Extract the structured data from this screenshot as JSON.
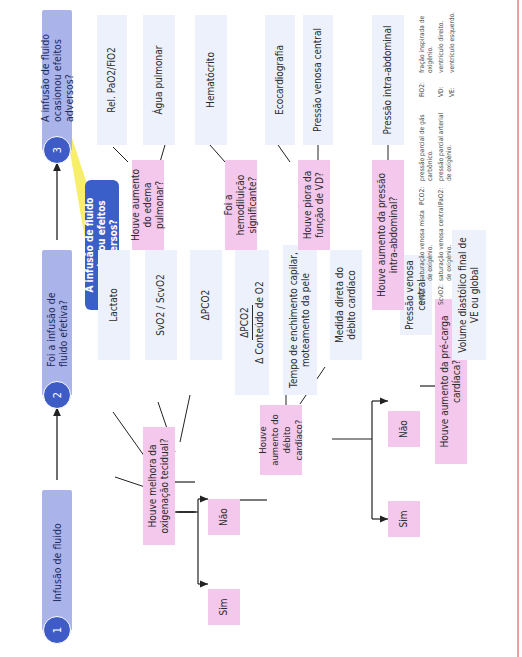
{
  "steps": [
    {
      "number": "1",
      "title": "Infusão de fluido"
    },
    {
      "number": "2",
      "title": "Foi a infusão de fluido efetiva?"
    },
    {
      "number": "3",
      "title": "A infusão de fluido ocasionou efeitos adversos?"
    }
  ],
  "callout": "A infusão de fluido ocasionou efeitos adversos?",
  "efficacy": {
    "question_oxygenation": "Houve melhora da oxigenação tecidual?",
    "oxygenation_markers": [
      "Lactato",
      "SvO2 / ScvO2",
      "ΔPCO2"
    ],
    "oxygenation_ratio": {
      "numerator": "ΔPCO2",
      "denominator": "Δ Conteúdo de O2"
    },
    "yes_label": "Sim",
    "no_label": "Não",
    "question_cardiac_output": "Houve aumento do débito cardíaco?",
    "cardiac_output_markers": [
      "Tempo de enchimento capilar, moteamento da pele",
      "Medida direta do débito cardíaco"
    ],
    "co_yes_label": "Sim",
    "co_no_label": "Não",
    "question_preload": "Houve aumento da pré-carga cardíaca?",
    "preload_markers": [
      "Pressão venosa central",
      "Volume diastólico final de VE ou global"
    ]
  },
  "adverse": [
    {
      "question": "Houve aumento do edema pulmonar?",
      "markers": [
        "Rel. PaO2/FiO2",
        "Água pulmonar"
      ]
    },
    {
      "question": "Foi a hemodiluição significante?",
      "markers": [
        "Hematócrito"
      ]
    },
    {
      "question": "Houve piora da função de VD?",
      "markers": [
        "Ecocardiografia",
        "Pressão venosa central"
      ]
    },
    {
      "question": "Houve aumento da pressão intra-abdominal?",
      "markers": [
        "Pressão intra-abdominal"
      ]
    }
  ],
  "legend": [
    {
      "abbr": "SvO2:",
      "text": "saturação venosa mista de oxigênio."
    },
    {
      "abbr": "ScvO2:",
      "text": "saturação venosa central de oxigênio."
    },
    {
      "abbr": "PCO2:",
      "text": "pressão parcial de gás carbônico."
    },
    {
      "abbr": "PaO2:",
      "text": "pressão parcial arterial de oxigênio."
    },
    {
      "abbr": "FiO2:",
      "text": "fração inspirada de oxigênio."
    },
    {
      "abbr": "VD:",
      "text": "ventrículo direito."
    },
    {
      "abbr": "VE:",
      "text": "ventrículo esquerdo."
    }
  ],
  "colors": {
    "header": "#aab3ea",
    "circle": "#3f5cc6",
    "question_box": "#f4c8ec",
    "marker_box": "#edf1fb",
    "callout": "#3b5fc8",
    "callout_pointer": "#f7ef6a"
  }
}
